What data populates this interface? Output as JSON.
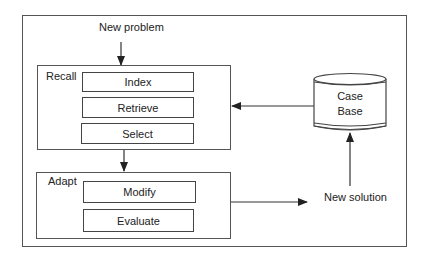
{
  "diagram": {
    "input_label": "New problem",
    "output_label": "New solution",
    "groups": [
      {
        "label": "Recall",
        "steps": [
          "Index",
          "Retrieve",
          "Select"
        ]
      },
      {
        "label": "Adapt",
        "steps": [
          "Modify",
          "Evaluate"
        ]
      }
    ],
    "store": {
      "line1": "Case",
      "line2": "Base"
    },
    "edges": [
      {
        "from": "New problem",
        "to": "Recall"
      },
      {
        "from": "Recall",
        "to": "Adapt"
      },
      {
        "from": "Adapt",
        "to": "New solution"
      },
      {
        "from": "New solution",
        "to": "Case Base"
      },
      {
        "from": "Case Base",
        "to": "Recall"
      }
    ],
    "colors": {
      "line": "#444444",
      "background": "#ffffff",
      "text": "#222222"
    }
  }
}
